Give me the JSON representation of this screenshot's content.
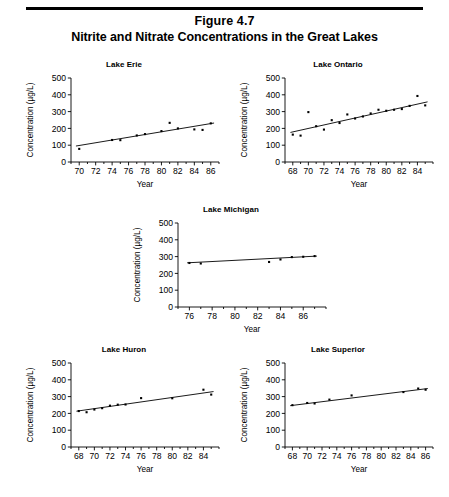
{
  "figure": {
    "number": "Figure 4.7",
    "title": "Nitrite and Nitrate Concentrations in the Great Lakes"
  },
  "axis_labels": {
    "x": "Year",
    "y": "Concentration (µg/L)"
  },
  "chart_data": [
    {
      "type": "scatter",
      "title": "Lake Erie",
      "xlabel": "Year",
      "ylabel": "Concentration (µg/L)",
      "xlim": [
        69,
        87
      ],
      "ylim": [
        0,
        500
      ],
      "xticks": [
        70,
        72,
        74,
        76,
        78,
        80,
        82,
        84,
        86
      ],
      "yticks": [
        0,
        100,
        200,
        300,
        400,
        500
      ],
      "grid": false,
      "legend": "none",
      "x": [
        70,
        74,
        75,
        77,
        78,
        80,
        81,
        82,
        84,
        85,
        86
      ],
      "values": [
        78,
        131,
        130,
        158,
        166,
        184,
        233,
        200,
        194,
        191,
        230
      ],
      "trend": {
        "x": [
          69.6,
          86.4
        ],
        "y": [
          95,
          232
        ]
      }
    },
    {
      "type": "scatter",
      "title": "Lake Ontario",
      "xlabel": "Year",
      "ylabel": "Concentration (µg/L)",
      "xlim": [
        67,
        86
      ],
      "ylim": [
        0,
        500
      ],
      "xticks": [
        68,
        70,
        72,
        74,
        76,
        78,
        80,
        82,
        84
      ],
      "yticks": [
        0,
        100,
        200,
        300,
        400,
        500
      ],
      "grid": false,
      "legend": "none",
      "x": [
        68,
        69,
        70,
        71,
        72,
        73,
        74,
        75,
        76,
        77,
        78,
        79,
        80,
        81,
        82,
        83,
        84,
        85
      ],
      "values": [
        163,
        157,
        297,
        213,
        193,
        249,
        232,
        283,
        259,
        271,
        289,
        311,
        305,
        311,
        315,
        334,
        393,
        337
      ],
      "trend": {
        "x": [
          67.7,
          85.3
        ],
        "y": [
          176,
          358
        ]
      }
    },
    {
      "type": "scatter",
      "title": "Lake Michigan",
      "xlabel": "Year",
      "ylabel": "Concentration (µg/L)",
      "xlim": [
        75,
        88
      ],
      "ylim": [
        0,
        500
      ],
      "xticks": [
        76,
        78,
        80,
        82,
        84,
        86
      ],
      "yticks": [
        0,
        100,
        200,
        300,
        400,
        500
      ],
      "grid": false,
      "legend": "none",
      "x": [
        76,
        77,
        83,
        84,
        85,
        86,
        87
      ],
      "values": [
        262,
        259,
        268,
        283,
        297,
        299,
        303
      ],
      "trend": {
        "x": [
          75.8,
          87.2
        ],
        "y": [
          263,
          303
        ]
      }
    },
    {
      "type": "scatter",
      "title": "Lake Huron",
      "xlabel": "Year",
      "ylabel": "Concentration (µg/L)",
      "xlim": [
        67,
        86
      ],
      "ylim": [
        0,
        500
      ],
      "xticks": [
        68,
        70,
        72,
        74,
        76,
        78,
        80,
        82,
        84
      ],
      "yticks": [
        0,
        100,
        200,
        300,
        400,
        500
      ],
      "grid": false,
      "legend": "none",
      "x": [
        68,
        69,
        70,
        71,
        72,
        73,
        74,
        76,
        80,
        84,
        85
      ],
      "values": [
        214,
        207,
        223,
        231,
        246,
        252,
        253,
        291,
        290,
        341,
        312
      ],
      "trend": {
        "x": [
          67.7,
          85.3
        ],
        "y": [
          213,
          330
        ]
      }
    },
    {
      "type": "scatter",
      "title": "Lake Superior",
      "xlabel": "Year",
      "ylabel": "Concentration (µg/L)",
      "xlim": [
        67,
        87
      ],
      "ylim": [
        0,
        500
      ],
      "xticks": [
        68,
        70,
        72,
        74,
        76,
        78,
        80,
        82,
        84,
        86
      ],
      "yticks": [
        0,
        100,
        200,
        300,
        400,
        500
      ],
      "grid": false,
      "legend": "none",
      "x": [
        68,
        70,
        71,
        73,
        76,
        83,
        85,
        86
      ],
      "values": [
        249,
        262,
        259,
        282,
        307,
        327,
        348,
        341
      ],
      "trend": {
        "x": [
          67.7,
          86.3
        ],
        "y": [
          246,
          348
        ]
      }
    }
  ]
}
